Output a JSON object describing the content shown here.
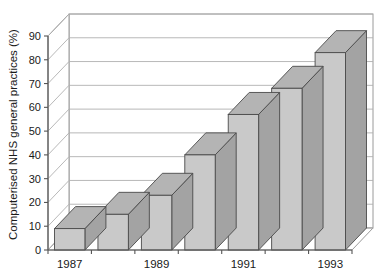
{
  "chart_data": {
    "type": "bar",
    "title": "",
    "subtitle": "",
    "xlabel": "",
    "ylabel": "Computerised NHS general practices (%)",
    "categories": [
      "1987",
      "1988",
      "1989",
      "1990",
      "1991",
      "1992",
      "1993"
    ],
    "tick_labels_x": [
      "1987",
      "",
      "1989",
      "",
      "1991",
      "",
      "1993"
    ],
    "values": [
      9,
      15,
      23,
      40,
      57,
      68,
      83
    ],
    "ylim": [
      0,
      90
    ],
    "ytick_values": [
      0,
      10,
      20,
      30,
      40,
      50,
      60,
      70,
      80,
      90
    ],
    "ytick_labels": [
      "0",
      "10",
      "20",
      "30",
      "40",
      "50",
      "60",
      "70",
      "80",
      "90"
    ],
    "grid": true,
    "grid_axis": "y",
    "legend": false,
    "legend_position": "none",
    "style": "3d-bar",
    "colors": {
      "bar_front": "#c9c9c9",
      "bar_side": "#a3a3a3",
      "bar_top": "#b4b4b4",
      "bar_edge": "#4a4a4a",
      "grid_line": "#b0b0b0",
      "axis_line": "#555555",
      "background": "#ffffff",
      "text": "#1a1a1a"
    }
  }
}
